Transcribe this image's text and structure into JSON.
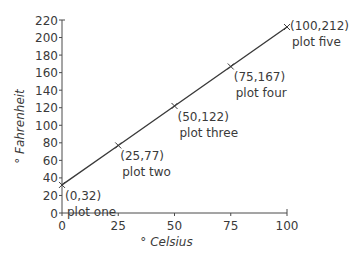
{
  "chart_data": {
    "type": "line",
    "title": "",
    "xlabel": "° Celsius",
    "ylabel": "° Fahrenheit",
    "xlim": [
      0,
      100
    ],
    "ylim": [
      0,
      220
    ],
    "x_ticks": [
      0,
      25,
      50,
      75,
      100
    ],
    "y_ticks": [
      0,
      20,
      40,
      60,
      80,
      100,
      120,
      140,
      160,
      180,
      200,
      220
    ],
    "grid": false,
    "legend": null,
    "series": [
      {
        "name": "Celsius to Fahrenheit",
        "x": [
          0,
          25,
          50,
          75,
          100
        ],
        "y": [
          32,
          77,
          122,
          167,
          212
        ],
        "marker": "x",
        "color": "#3a3a3a"
      }
    ],
    "annotations": [
      {
        "coord": "(0,32)",
        "label": "plot one"
      },
      {
        "coord": "(25,77)",
        "label": "plot two"
      },
      {
        "coord": "(50,122)",
        "label": "plot three"
      },
      {
        "coord": "(75,167)",
        "label": "plot four"
      },
      {
        "coord": "(100,212)",
        "label": "plot five"
      }
    ]
  }
}
